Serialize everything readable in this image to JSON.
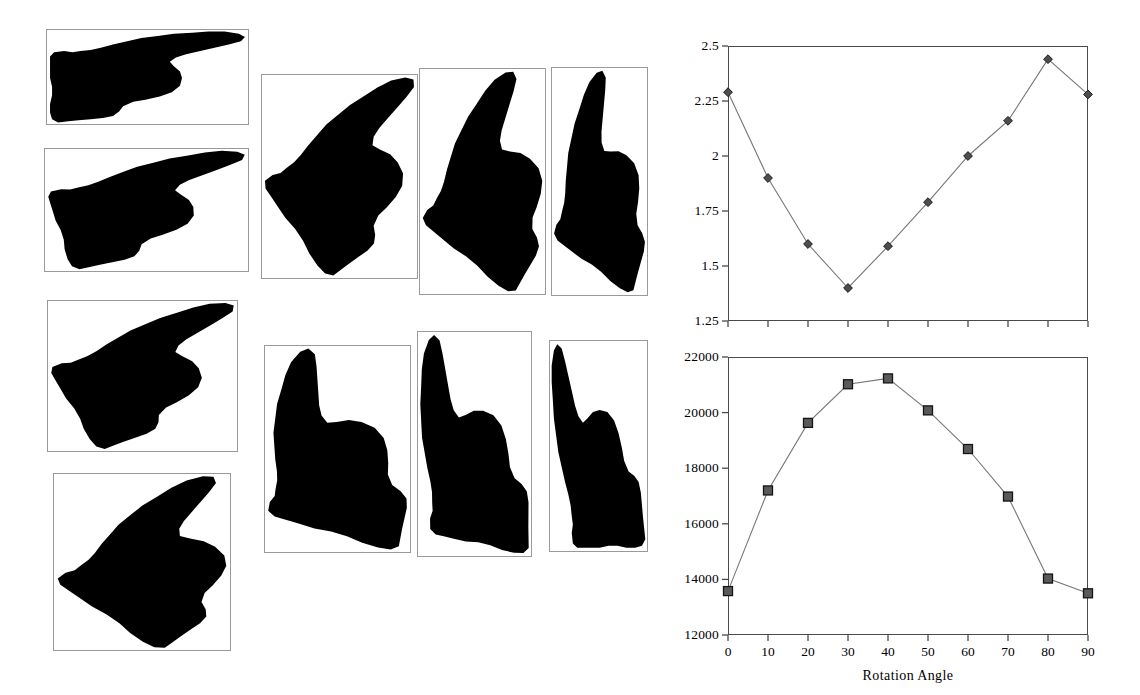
{
  "figure": {
    "background": "#ffffff",
    "hand_images": {
      "description": "binary silhouette of a pointing hand at successive rotation angles",
      "silhouette_color": "#000000",
      "frame_color": "#9a9a9a",
      "panels": [
        {
          "label": "hand-rotation-0",
          "angle": 0,
          "x": 46,
          "y": 29,
          "w": 203,
          "h": 96
        },
        {
          "label": "hand-rotation-10",
          "angle": 10,
          "x": 44,
          "y": 148,
          "w": 205,
          "h": 124
        },
        {
          "label": "hand-rotation-20",
          "angle": 20,
          "x": 47,
          "y": 300,
          "w": 191,
          "h": 152
        },
        {
          "label": "hand-rotation-30",
          "angle": 30,
          "x": 261,
          "y": 74,
          "w": 157,
          "h": 205
        },
        {
          "label": "hand-rotation-40",
          "angle": 40,
          "x": 53,
          "y": 473,
          "w": 178,
          "h": 178
        },
        {
          "label": "hand-rotation-50",
          "angle": 50,
          "x": 419,
          "y": 68,
          "w": 127,
          "h": 227
        },
        {
          "label": "hand-rotation-60",
          "angle": 60,
          "x": 551,
          "y": 67,
          "w": 97,
          "h": 229
        },
        {
          "label": "hand-rotation-70",
          "angle": 70,
          "x": 264,
          "y": 345,
          "w": 147,
          "h": 208
        },
        {
          "label": "hand-rotation-80",
          "angle": 80,
          "x": 417,
          "y": 331,
          "w": 115,
          "h": 226
        },
        {
          "label": "hand-rotation-90",
          "angle": 90,
          "x": 549,
          "y": 340,
          "w": 99,
          "h": 212
        }
      ]
    }
  },
  "chart_data": [
    {
      "name": "top-chart",
      "type": "line",
      "marker": "diamond",
      "x": [
        0,
        10,
        20,
        30,
        40,
        50,
        60,
        70,
        80,
        90
      ],
      "values": [
        2.29,
        1.9,
        1.6,
        1.4,
        1.59,
        1.79,
        2.0,
        2.16,
        2.44,
        2.28
      ],
      "xlabel": "",
      "ylabel": "",
      "title": "",
      "xlim": [
        0,
        90
      ],
      "ylim": [
        1.25,
        2.5
      ],
      "yticks": [
        1.25,
        1.5,
        1.75,
        2,
        2.25,
        2.5
      ],
      "ytick_labels": [
        "1.25",
        "1.5",
        "1.75",
        "2",
        "2.25",
        "2.5"
      ],
      "xticks": [
        0,
        10,
        20,
        30,
        40,
        50,
        60,
        70,
        80,
        90
      ],
      "xtick_labels": [],
      "grid": false,
      "legend": "none",
      "line_color": "#777777",
      "marker_color": "#4d4d4d"
    },
    {
      "name": "bottom-chart",
      "type": "line",
      "marker": "square",
      "x": [
        0,
        10,
        20,
        30,
        40,
        50,
        60,
        70,
        80,
        90
      ],
      "values": [
        13580,
        17200,
        19630,
        21020,
        21230,
        20080,
        18690,
        16980,
        14030,
        13500
      ],
      "xlabel": "Rotation Angle",
      "ylabel": "",
      "title": "",
      "xlim": [
        0,
        90
      ],
      "ylim": [
        12000,
        22000
      ],
      "yticks": [
        12000,
        14000,
        16000,
        18000,
        20000,
        22000
      ],
      "ytick_labels": [
        "12000",
        "14000",
        "16000",
        "18000",
        "20000",
        "22000"
      ],
      "xticks": [
        0,
        10,
        20,
        30,
        40,
        50,
        60,
        70,
        80,
        90
      ],
      "xtick_labels": [
        "0",
        "10",
        "20",
        "30",
        "40",
        "50",
        "60",
        "70",
        "80",
        "90"
      ],
      "grid": false,
      "legend": "none",
      "line_color": "#777777",
      "marker_color": "#595959"
    }
  ]
}
